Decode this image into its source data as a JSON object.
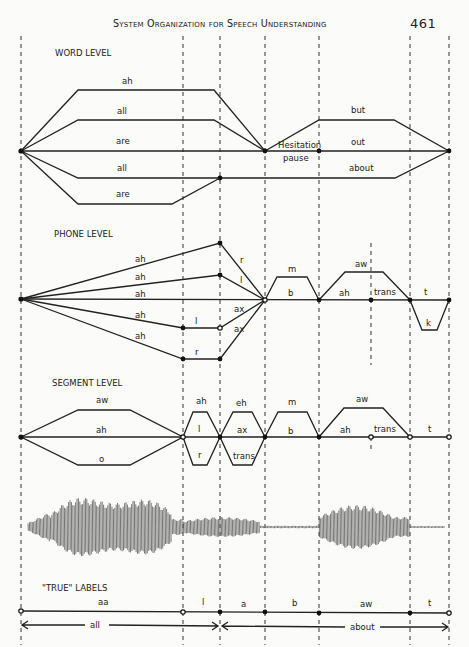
{
  "header": {
    "title": "System Organization for Speech Understanding",
    "page_number": "461"
  },
  "sections": {
    "word_level": {
      "title": "WORD LEVEL",
      "upper_paths": [
        "ah",
        "all",
        "are"
      ],
      "lower_paths": [
        "all",
        "are"
      ],
      "middle_labels": [
        "Hesitation",
        "pause"
      ],
      "right_paths": [
        "but",
        "out",
        "about"
      ]
    },
    "phone_level": {
      "title": "PHONE LEVEL",
      "fan_labels": [
        "ah",
        "ah",
        "ah",
        "ah",
        "ah"
      ],
      "mid_labels": [
        "l",
        "r"
      ],
      "converge_labels": [
        "r",
        "l",
        "ax",
        "ax"
      ],
      "right_labels": [
        "m",
        "b",
        "aw",
        "ah",
        "trans",
        "t",
        "k"
      ]
    },
    "segment_level": {
      "title": "SEGMENT LEVEL",
      "first_labels": [
        "aw",
        "ah",
        "o"
      ],
      "second_labels": [
        "ah",
        "l",
        "r"
      ],
      "third_labels": [
        "eh",
        "ax",
        "trans"
      ],
      "fourth_labels": [
        "m",
        "b"
      ],
      "fifth_labels": [
        "aw",
        "ah",
        "trans"
      ],
      "last_label": "t"
    },
    "true_labels": {
      "title": "\"TRUE\" LABELS",
      "segments": [
        "aa",
        "l",
        "a",
        "b",
        "aw",
        "t"
      ],
      "words": [
        "all",
        "about"
      ]
    }
  }
}
